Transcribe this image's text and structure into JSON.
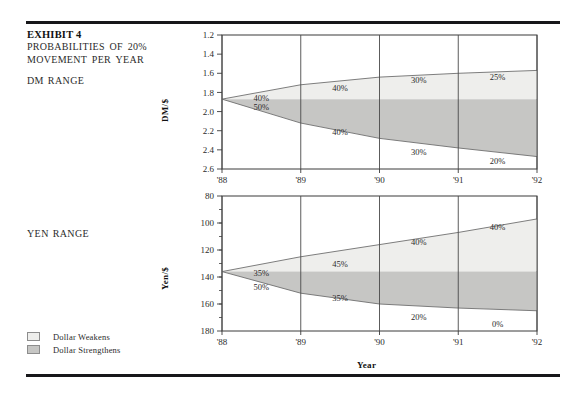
{
  "exhibit": {
    "title": "EXHIBIT 4",
    "subtitle_line1": "PROBABILITIES OF 20%",
    "subtitle_line2": "MOVEMENT PER YEAR",
    "dm_range_label": "DM RANGE",
    "yen_range_label": "YEN RANGE"
  },
  "legend": {
    "items": [
      {
        "label": "Dollar Weakens",
        "color": "#eeeeec"
      },
      {
        "label": "Dollar Strengthens",
        "color": "#c6c6c4"
      }
    ]
  },
  "axis": {
    "xlabel": "Year",
    "xticks": [
      "'88",
      "'89",
      "'90",
      "'91",
      "'92"
    ]
  },
  "colors": {
    "band_weak": "#eeeeec",
    "band_strong": "#c6c6c4",
    "line": "#6f6f6f",
    "frame": "#3b3b3b",
    "rule": "#17171a"
  },
  "chart_data": [
    {
      "type": "area",
      "title": "DM RANGE",
      "ylabel": "DM/$",
      "xlabel": "Year",
      "x": [
        "'88",
        "'89",
        "'90",
        "'91",
        "'92"
      ],
      "ylim": [
        1.2,
        2.6
      ],
      "y_inverted": true,
      "yticks": [
        1.2,
        1.4,
        1.6,
        1.8,
        2.0,
        2.2,
        2.4,
        2.6
      ],
      "ytick_labels": [
        "1.2",
        "1.4",
        "1.6",
        "1.8",
        "2.0",
        "2.2",
        "2.4",
        "2.6"
      ],
      "grid": false,
      "series": [
        {
          "name": "Dollar Weakens (upper bound)",
          "values": [
            1.87,
            1.72,
            1.64,
            1.6,
            1.57
          ]
        },
        {
          "name": "Center (spot)",
          "values": [
            1.87,
            1.87,
            1.87,
            1.87,
            1.87
          ]
        },
        {
          "name": "Dollar Strengthens (lower bound)",
          "values": [
            1.87,
            2.12,
            2.28,
            2.38,
            2.47
          ]
        }
      ],
      "annotations_upper": [
        "50%",
        "40%",
        "30%",
        "25%"
      ],
      "annotations_lower": [
        "40%",
        "40%",
        "30%",
        "20%"
      ]
    },
    {
      "type": "area",
      "title": "YEN RANGE",
      "ylabel": "Yen/$",
      "xlabel": "Year",
      "x": [
        "'88",
        "'89",
        "'90",
        "'91",
        "'92"
      ],
      "ylim": [
        80,
        180
      ],
      "y_inverted": true,
      "yticks": [
        80,
        100,
        120,
        140,
        160,
        180
      ],
      "ytick_labels": [
        "80",
        "100",
        "120",
        "140",
        "160",
        "180"
      ],
      "minor_tick_step": 10,
      "grid": false,
      "series": [
        {
          "name": "Dollar Weakens (upper bound)",
          "values": [
            136,
            125,
            116,
            107,
            97
          ]
        },
        {
          "name": "Center (spot)",
          "values": [
            136,
            136,
            136,
            136,
            136
          ]
        },
        {
          "name": "Dollar Strengthens (lower bound)",
          "values": [
            136,
            152,
            160,
            163,
            165
          ]
        }
      ],
      "annotations_upper": [
        "50%",
        "45%",
        "40%",
        "40%"
      ],
      "annotations_lower": [
        "35%",
        "35%",
        "20%",
        "0%"
      ]
    }
  ]
}
